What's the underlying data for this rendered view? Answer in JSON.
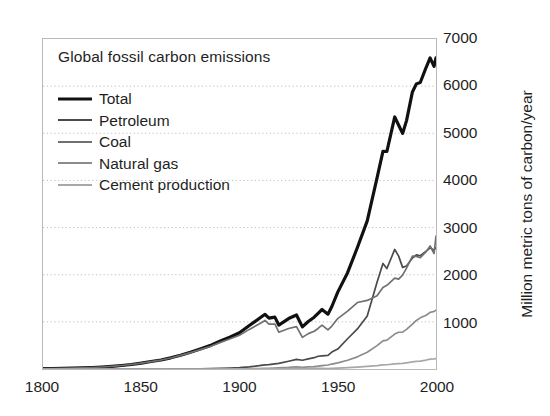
{
  "chart_data": {
    "type": "line",
    "title": "Global fossil carbon emissions",
    "xlabel": "",
    "ylabel": "Million metric tons of carbon/year",
    "xlim": [
      1800,
      2000
    ],
    "ylim": [
      0,
      7000
    ],
    "xticks": [
      1800,
      1850,
      1900,
      1950,
      2000
    ],
    "yticks": [
      0,
      1000,
      2000,
      3000,
      4000,
      5000,
      6000,
      7000
    ],
    "ytick_labels": [
      "",
      "1000",
      "2000",
      "3000",
      "4000",
      "5000",
      "6000",
      "7000"
    ],
    "grid": "horizontal-dotted",
    "legend_position": "upper-left-inside",
    "x": [
      1800,
      1805,
      1810,
      1815,
      1820,
      1825,
      1830,
      1835,
      1840,
      1845,
      1850,
      1855,
      1860,
      1865,
      1870,
      1875,
      1880,
      1885,
      1890,
      1895,
      1900,
      1905,
      1910,
      1913,
      1915,
      1918,
      1920,
      1925,
      1929,
      1932,
      1935,
      1938,
      1940,
      1942,
      1945,
      1947,
      1950,
      1955,
      1960,
      1965,
      1970,
      1973,
      1975,
      1979,
      1981,
      1983,
      1985,
      1988,
      1990,
      1992,
      1995,
      1997,
      1999,
      2000
    ],
    "series": [
      {
        "name": "Total",
        "color": "#111111",
        "width": 3.2,
        "values": [
          8,
          11,
          15,
          20,
          25,
          32,
          42,
          56,
          74,
          95,
          124,
          158,
          192,
          237,
          293,
          355,
          424,
          496,
          590,
          675,
          770,
          922,
          1070,
          1160,
          1078,
          1100,
          932,
          1070,
          1145,
          893,
          1008,
          1098,
          1182,
          1262,
          1163,
          1326,
          1630,
          2043,
          2577,
          3142,
          4053,
          4615,
          4614,
          5347,
          5170,
          4997,
          5269,
          5877,
          6048,
          6078,
          6400,
          6600,
          6420,
          6600
        ]
      },
      {
        "name": "Petroleum",
        "color": "#4a4a4a",
        "width": 1.7,
        "values": [
          0,
          0,
          0,
          0,
          0,
          0,
          0,
          0,
          0,
          0,
          0,
          0,
          0,
          1,
          2,
          3,
          5,
          8,
          13,
          20,
          30,
          45,
          70,
          88,
          92,
          110,
          120,
          165,
          205,
          185,
          215,
          240,
          270,
          280,
          290,
          360,
          423,
          642,
          849,
          1124,
          1839,
          2238,
          2131,
          2536,
          2394,
          2156,
          2186,
          2354,
          2420,
          2402,
          2500,
          2570,
          2520,
          2580
        ]
      },
      {
        "name": "Coal",
        "color": "#707070",
        "width": 1.7,
        "values": [
          8,
          11,
          15,
          20,
          25,
          32,
          42,
          56,
          74,
          95,
          124,
          158,
          190,
          234,
          289,
          348,
          412,
          478,
          560,
          635,
          715,
          840,
          955,
          1030,
          950,
          955,
          780,
          860,
          900,
          670,
          750,
          800,
          860,
          930,
          830,
          910,
          1070,
          1228,
          1410,
          1455,
          1556,
          1731,
          1774,
          1929,
          1906,
          1992,
          2140,
          2394,
          2390,
          2362,
          2490,
          2610,
          2450,
          2820
        ]
      },
      {
        "name": "Natural gas",
        "color": "#8c8c8c",
        "width": 1.7,
        "values": [
          0,
          0,
          0,
          0,
          0,
          0,
          0,
          0,
          0,
          0,
          0,
          0,
          0,
          0,
          0,
          0,
          0,
          0,
          1,
          2,
          3,
          5,
          9,
          12,
          14,
          18,
          22,
          33,
          46,
          35,
          44,
          52,
          60,
          72,
          85,
          105,
          130,
          185,
          258,
          355,
          495,
          598,
          613,
          740,
          780,
          782,
          840,
          950,
          1030,
          1085,
          1140,
          1200,
          1220,
          1250
        ]
      },
      {
        "name": "Cement production",
        "color": "#a8a8a8",
        "width": 1.7,
        "values": [
          0,
          0,
          0,
          0,
          0,
          0,
          0,
          0,
          0,
          0,
          0,
          0,
          0,
          0,
          0,
          0,
          0,
          0,
          0,
          0,
          1,
          2,
          3,
          4,
          4,
          5,
          6,
          9,
          12,
          8,
          10,
          13,
          14,
          12,
          10,
          14,
          18,
          28,
          40,
          55,
          72,
          87,
          90,
          110,
          116,
          120,
          131,
          150,
          160,
          168,
          190,
          210,
          215,
          222
        ]
      }
    ]
  },
  "axes": {
    "ylabel": "Million metric tons of carbon/year",
    "ytick_labels": [
      "1000",
      "2000",
      "3000",
      "4000",
      "5000",
      "6000",
      "7000"
    ],
    "xtick_labels": [
      "1800",
      "1850",
      "1900",
      "1950",
      "2000"
    ]
  },
  "legend": {
    "items": [
      {
        "label": "Total"
      },
      {
        "label": "Petroleum"
      },
      {
        "label": "Coal"
      },
      {
        "label": "Natural gas"
      },
      {
        "label": "Cement production"
      }
    ]
  }
}
